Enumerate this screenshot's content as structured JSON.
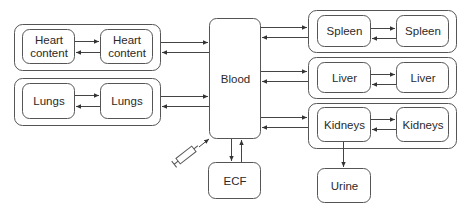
{
  "diagram": {
    "central": {
      "label": "Blood"
    },
    "left_groups": [
      {
        "name": "heart",
        "compartment_a": "Heart content",
        "compartment_b": "Heart content"
      },
      {
        "name": "lungs",
        "compartment_a": "Lungs",
        "compartment_b": "Lungs"
      }
    ],
    "right_groups": [
      {
        "name": "spleen",
        "compartment_a": "Spleen",
        "compartment_b": "Spleen"
      },
      {
        "name": "liver",
        "compartment_a": "Liver",
        "compartment_b": "Liver"
      },
      {
        "name": "kidneys",
        "compartment_a": "Kidneys",
        "compartment_b": "Kidneys"
      }
    ],
    "ecf": {
      "label": "ECF"
    },
    "urine": {
      "label": "Urine"
    },
    "injection": {
      "icon": "syringe-icon"
    },
    "colors": {
      "stroke": "#555555",
      "text": "#2a2a2a",
      "background": "#ffffff"
    }
  }
}
